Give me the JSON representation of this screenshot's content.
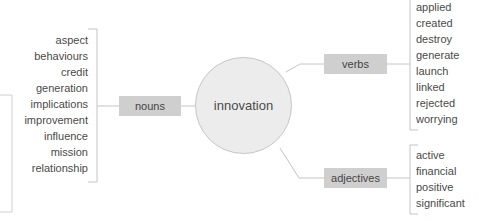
{
  "diagram": {
    "center": {
      "label": "innovation"
    },
    "branches": {
      "nouns": {
        "label": "nouns",
        "words": [
          "aspect",
          "behaviours",
          "credit",
          "generation",
          "implications",
          "improvement",
          "influence",
          "mission",
          "relationship"
        ]
      },
      "verbs": {
        "label": "verbs",
        "words": [
          "applied",
          "created",
          "destroy",
          "generate",
          "launch",
          "linked",
          "rejected",
          "worrying"
        ]
      },
      "adjectives": {
        "label": "adjectives",
        "words": [
          "active",
          "financial",
          "positive",
          "significant"
        ]
      }
    },
    "colors": {
      "box_fill": "#cfcfcf",
      "hub_fill": "#ececec",
      "line": "#c4c4c4",
      "text": "#4a4a4a"
    }
  }
}
